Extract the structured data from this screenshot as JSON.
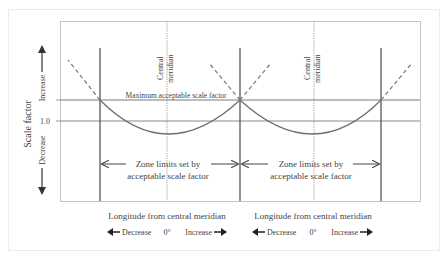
{
  "diagram": {
    "y_axis": {
      "label": "Scale factor",
      "increase_label": "Increase",
      "decrease_label": "Decrease",
      "unity_label": "1.0"
    },
    "max_line_label": "Maximum acceptable scale factor",
    "zones": [
      {
        "central_meridian_label_line1": "Central",
        "central_meridian_label_line2": "meridian",
        "zone_limits_line1": "Zone limits set by",
        "zone_limits_line2": "acceptable scale factor",
        "x_axis_title": "Longitude from central meridian",
        "decrease_label": "Decrease",
        "zero_label": "0°",
        "increase_label": "Increase"
      },
      {
        "central_meridian_label_line1": "Central",
        "central_meridian_label_line2": "meridian",
        "zone_limits_line1": "Zone limits set by",
        "zone_limits_line2": "acceptable scale factor",
        "x_axis_title": "Longitude from central meridian",
        "decrease_label": "Decrease",
        "zero_label": "0°",
        "increase_label": "Increase"
      }
    ],
    "colors": {
      "frame": "#bdbdbd",
      "zone_boundary": "#555555",
      "horizontal_line": "#7a7a7a",
      "curve": "#6e6e6e",
      "meridian_dotted": "#9a9a9a",
      "text": "#444444"
    }
  }
}
